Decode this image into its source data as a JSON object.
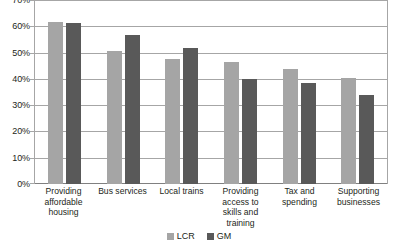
{
  "chart_data": {
    "type": "bar",
    "title": "",
    "subtitle": "",
    "xlabel": "",
    "ylabel": "",
    "ylim": [
      0,
      70
    ],
    "ytick_step": 10,
    "ytick_labels": [
      "0%",
      "10%",
      "20%",
      "30%",
      "40%",
      "50%",
      "60%",
      "70%"
    ],
    "ytick_values": [
      0,
      10,
      20,
      30,
      40,
      50,
      60,
      70
    ],
    "grid": true,
    "legend_position": "bottom",
    "categories": [
      "Providing affordable housing",
      "Bus services",
      "Local trains",
      "Providing access to skills and training",
      "Tax and spending",
      "Supporting businesses"
    ],
    "series": [
      {
        "name": "LCR",
        "color": "#a5a5a5",
        "values": [
          62,
          51,
          48,
          46.5,
          44,
          40.5
        ]
      },
      {
        "name": "GM",
        "color": "#595959",
        "values": [
          61.5,
          57,
          52,
          40,
          38.5,
          34
        ]
      }
    ]
  },
  "legend": {
    "items": [
      {
        "label": "LCR",
        "color": "#a5a5a5"
      },
      {
        "label": "GM",
        "color": "#595959"
      }
    ]
  },
  "colors": {
    "lcr": "#a5a5a5",
    "gm": "#595959",
    "gridline": "#a6a6a6",
    "text": "#231f20",
    "background": "#ffffff"
  }
}
